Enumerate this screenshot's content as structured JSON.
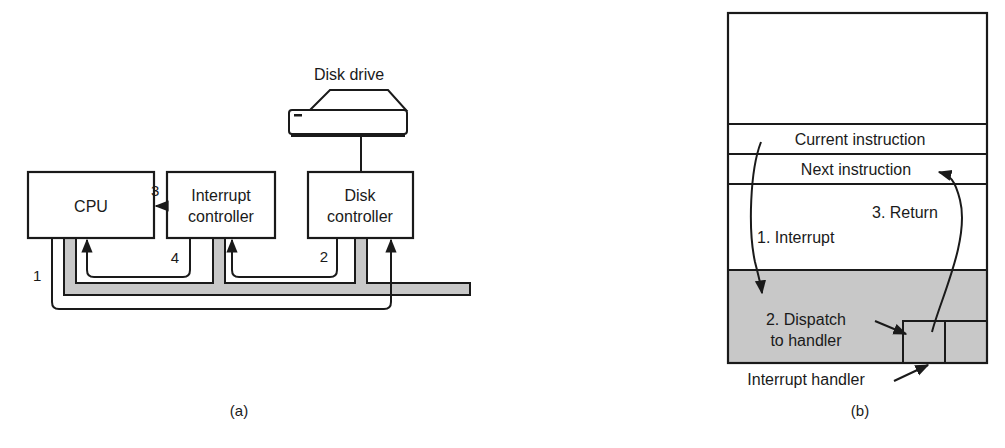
{
  "figure_a": {
    "caption": "(a)",
    "cpu": {
      "label": "CPU"
    },
    "interrupt_controller": {
      "line1": "Interrupt",
      "line2": "controller"
    },
    "disk_controller": {
      "line1": "Disk",
      "line2": "controller"
    },
    "disk_drive": {
      "label": "Disk drive"
    },
    "steps": {
      "s1": "1",
      "s2": "2",
      "s3": "3",
      "s4": "4"
    }
  },
  "figure_b": {
    "caption": "(b)",
    "current_instruction": "Current instruction",
    "next_instruction": "Next instruction",
    "step1": "1. Interrupt",
    "step2_line1": "2. Dispatch",
    "step2_line2": "to handler",
    "step3": "3. Return",
    "interrupt_handler": "Interrupt handler"
  },
  "colors": {
    "line": "#1a1a1a",
    "bus_fill": "#c8c8c8",
    "shaded_region": "#c8c8c8",
    "background": "#ffffff"
  }
}
